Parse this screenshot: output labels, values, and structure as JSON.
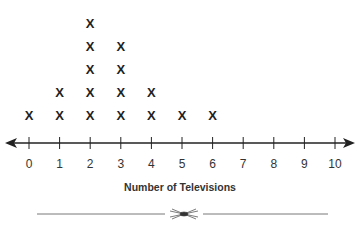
{
  "chart_data": {
    "type": "line_plot",
    "title": "",
    "xlabel": "Number of Televisions",
    "ylabel": "",
    "categories": [
      0,
      1,
      2,
      3,
      4,
      5,
      6,
      7,
      8,
      9,
      10
    ],
    "values": [
      1,
      2,
      5,
      4,
      2,
      1,
      1,
      0,
      0,
      0,
      0
    ],
    "marker": "X",
    "xlim": [
      0,
      10
    ],
    "grid": false
  },
  "axis": {
    "tick_labels": [
      "0",
      "1",
      "2",
      "3",
      "4",
      "5",
      "6",
      "7",
      "8",
      "9",
      "10"
    ]
  },
  "xlabel": "Number of Televisions",
  "marker_glyph": "X"
}
